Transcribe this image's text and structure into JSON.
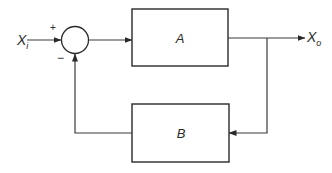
{
  "diagram": {
    "type": "feedback-control-block-diagram",
    "input": {
      "label_main": "X",
      "label_sub": "i"
    },
    "output": {
      "label_main": "X",
      "label_sub": "o"
    },
    "summing_junction": {
      "plus_sign": "+",
      "minus_sign": "−"
    },
    "forward_block": {
      "label": "A"
    },
    "feedback_block": {
      "label": "B"
    },
    "colors": {
      "line": "#3a3a3a",
      "text": "#2a2a2a",
      "background": "#ffffff"
    }
  }
}
